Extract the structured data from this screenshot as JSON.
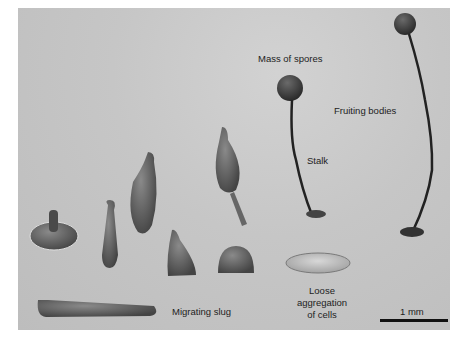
{
  "figure": {
    "labels": {
      "mass_of_spores": "Mass of spores",
      "fruiting_bodies": "Fruiting bodies",
      "stalk": "Stalk",
      "migrating_slug": "Migrating slug",
      "loose_aggregation_line1": "Loose",
      "loose_aggregation_line2": "aggregation",
      "loose_aggregation_line3": "of cells"
    },
    "scale_bar": {
      "label": "1 mm"
    },
    "colors": {
      "background": "#c6c6c6",
      "organism": "#5a5a5a",
      "text": "#222222"
    }
  }
}
